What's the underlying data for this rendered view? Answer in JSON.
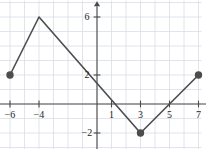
{
  "chart_data": {
    "type": "line",
    "title": "",
    "xlabel": "x",
    "ylabel": "y",
    "grid": true,
    "legend": false,
    "xlim": [
      -7.3,
      8.2
    ],
    "ylim": [
      -3.3,
      7.2
    ],
    "grid_step": 1,
    "x_ticks": [
      -6,
      -4,
      1,
      3,
      5,
      7
    ],
    "x_tick_labels": [
      "−6",
      "−4",
      "1",
      "3",
      "5",
      "7"
    ],
    "y_ticks": [
      6,
      2,
      -2
    ],
    "y_tick_labels": [
      "6",
      "2",
      "−2"
    ],
    "series": [
      {
        "name": "piecewise-linear",
        "x": [
          -6,
          -4,
          3,
          7
        ],
        "y": [
          2,
          6,
          -2,
          2
        ],
        "endpoints_filled": [
          true,
          false,
          true,
          true
        ],
        "color": "#4d4d4d"
      }
    ],
    "points": [
      {
        "x": -6,
        "y": 2,
        "style": "filled"
      },
      {
        "x": 3,
        "y": -2,
        "style": "filled"
      },
      {
        "x": 7,
        "y": 2,
        "style": "filled"
      }
    ],
    "colors": {
      "grid": "#d9dde4",
      "axis": "#4a4a4a",
      "curve": "#4d4d4d",
      "text": "#231f20",
      "background": "#ffffff"
    }
  }
}
